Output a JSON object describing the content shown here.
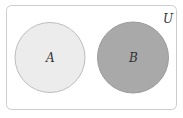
{
  "diagram": {
    "type": "venn",
    "universe": {
      "label": "U",
      "fill": "#ffffff",
      "stroke": "#cccccc"
    },
    "sets": [
      {
        "label": "A",
        "fill": "#ececec",
        "stroke": "#bdbdbd"
      },
      {
        "label": "B",
        "fill": "#a9a9a9",
        "stroke": "#9a9a9a"
      }
    ],
    "relationship": "disjoint"
  }
}
